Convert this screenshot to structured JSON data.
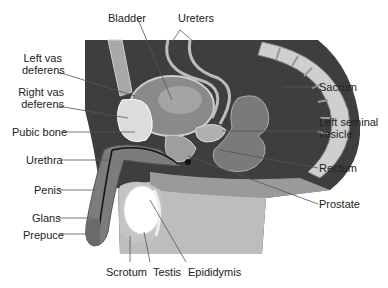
{
  "colors": {
    "background": "#ffffff",
    "dark_tissue": "#4a4a4a",
    "mid_tissue": "#8c8c8c",
    "light_tissue": "#c8c8c8",
    "bone": "#d9d9d9",
    "leader_line": "#555555",
    "text": "#222222"
  },
  "labels": {
    "bladder": "Bladder",
    "ureters": "Ureters",
    "left_vas_deferens": [
      "Left vas",
      "deferens"
    ],
    "right_vas_deferens": [
      "Right vas",
      "deferens"
    ],
    "pubic_bone": "Pubic bone",
    "urethra": "Urethra",
    "penis": "Penis",
    "glans": "Glans",
    "prepuce": "Prepuce",
    "scrotum": "Scrotum",
    "testis": "Testis",
    "epididymis": "Epididymis",
    "sacrum": "Sacrum",
    "left_seminal_vesicle": [
      "Left seminal",
      "vesicle"
    ],
    "rectum": "Rectum",
    "prostate": "Prostate"
  }
}
